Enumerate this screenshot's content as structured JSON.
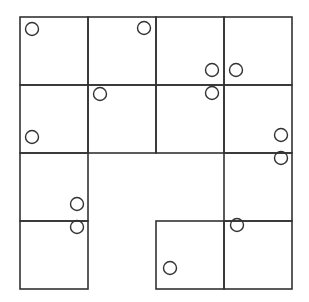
{
  "diagram": {
    "type": "grid-puzzle",
    "grid": {
      "origin_x": 20,
      "origin_y": 17,
      "cell_size": 68,
      "rows": 4,
      "cols": 4,
      "stroke_color": "#333333"
    },
    "cells": [
      {
        "row": 0,
        "col": 0
      },
      {
        "row": 0,
        "col": 1
      },
      {
        "row": 0,
        "col": 2
      },
      {
        "row": 0,
        "col": 3
      },
      {
        "row": 1,
        "col": 0
      },
      {
        "row": 1,
        "col": 1
      },
      {
        "row": 1,
        "col": 2
      },
      {
        "row": 1,
        "col": 3
      },
      {
        "row": 2,
        "col": 0
      },
      {
        "row": 2,
        "col": 3
      },
      {
        "row": 3,
        "col": 0
      },
      {
        "row": 3,
        "col": 2
      },
      {
        "row": 3,
        "col": 3
      }
    ],
    "circles": [
      {
        "x": 32,
        "y": 29
      },
      {
        "x": 144,
        "y": 28
      },
      {
        "x": 212,
        "y": 70
      },
      {
        "x": 236,
        "y": 70
      },
      {
        "x": 100,
        "y": 94
      },
      {
        "x": 212,
        "y": 93
      },
      {
        "x": 32,
        "y": 137
      },
      {
        "x": 281,
        "y": 135
      },
      {
        "x": 281,
        "y": 158
      },
      {
        "x": 77,
        "y": 204
      },
      {
        "x": 77,
        "y": 227
      },
      {
        "x": 237,
        "y": 225
      },
      {
        "x": 170,
        "y": 268
      }
    ],
    "circle_radius": 6.5
  }
}
